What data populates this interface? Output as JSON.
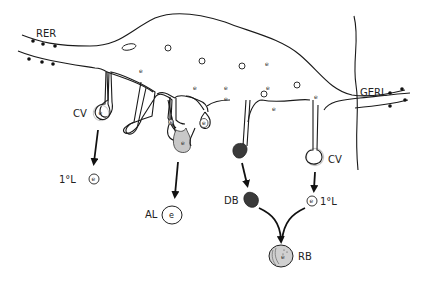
{
  "diagram": {
    "labels": {
      "rer": "RER",
      "gerl": "GERL",
      "cv_left": "CV",
      "cv_right": "CV",
      "primary_lysosome_left": "1°L",
      "primary_lysosome_right": "1°L",
      "autophagic_lysosome": "AL",
      "dense_body": "DB",
      "residual_body": "RB"
    },
    "enzyme_marker": "e",
    "colors": {
      "line": "#1a1a1a",
      "autophagic_fill": "#c8c8c8",
      "dense_body_fill": "#3a3a3a",
      "residual_body_fill": "#d0d0d0",
      "vesicle_halo": "#bbbbbb"
    }
  }
}
